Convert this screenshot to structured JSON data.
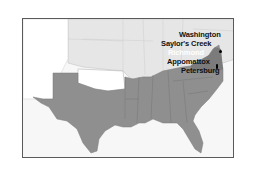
{
  "map": {
    "title": "",
    "colors": {
      "confederacy": "#8f8f8f",
      "union": "#e6e6e6",
      "territories": "#ffffff",
      "water": "#f7f7f7",
      "border": "#5a5a5a",
      "label": "#111111"
    },
    "labels": [
      {
        "id": "washington",
        "text": "Washington"
      },
      {
        "id": "saylors-creek",
        "text": "Saylor's Creek"
      },
      {
        "id": "richmond",
        "text": "Richmond"
      },
      {
        "id": "appomattox",
        "text": "Appomattox"
      },
      {
        "id": "petersburg",
        "text": "Petersburg"
      }
    ]
  }
}
